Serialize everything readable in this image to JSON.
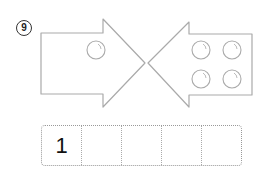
{
  "question": {
    "number_label": "9"
  },
  "figure": {
    "left_arrow": {
      "direction": "right",
      "circle_count": 1
    },
    "right_arrow": {
      "direction": "left",
      "circle_count": 4
    },
    "stroke_color": "#aaaaaa"
  },
  "answer_boxes": {
    "cells": [
      "1",
      "",
      "",
      "",
      ""
    ]
  }
}
